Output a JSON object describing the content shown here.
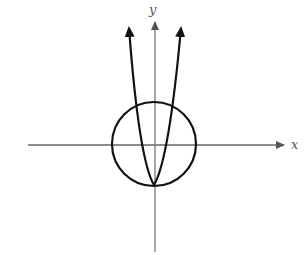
{
  "diagram": {
    "title": "",
    "axes": {
      "x_label": "x",
      "y_label": "y",
      "color": "#777777"
    },
    "curves": [
      {
        "type": "circle",
        "center": [
          154,
          144
        ],
        "radius": 42,
        "color": "#111111"
      },
      {
        "type": "parabola",
        "orientation": "upward",
        "vertex": [
          154,
          185
        ],
        "arrows": "both ends",
        "color": "#111111"
      }
    ]
  }
}
